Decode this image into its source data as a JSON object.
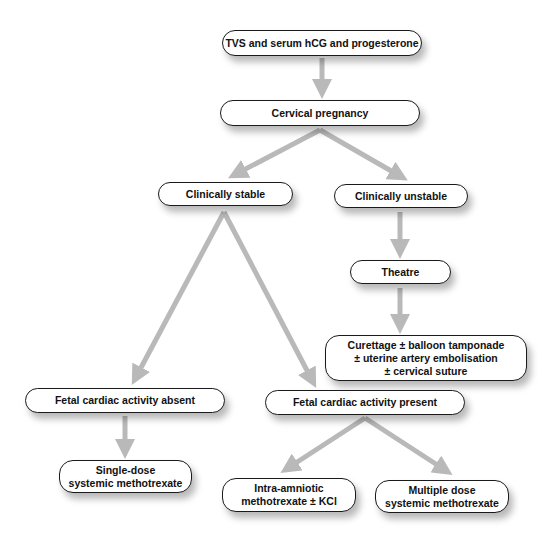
{
  "diagram": {
    "arrow_color": "#b9b9b9",
    "nodes": {
      "tvs": "TVS and serum hCG and progesterone",
      "cervical_pregnancy": "Cervical pregnancy",
      "clinically_stable": "Clinically stable",
      "clinically_unstable": "Clinically unstable",
      "theatre": "Theatre",
      "curettage": "Curettage ± balloon tamponade\n± uterine artery embolisation\n± cervical suture",
      "fetal_absent": "Fetal cardiac activity absent",
      "fetal_present": "Fetal cardiac activity present",
      "single_dose": "Single-dose\nsystemic methotrexate",
      "intra_amniotic": "Intra-amniotic\nmethotrexate ± KCl",
      "multiple_dose": "Multiple dose\nsystemic methotrexate"
    },
    "edges": [
      [
        "tvs",
        "cervical_pregnancy"
      ],
      [
        "cervical_pregnancy",
        "clinically_stable"
      ],
      [
        "cervical_pregnancy",
        "clinically_unstable"
      ],
      [
        "clinically_unstable",
        "theatre"
      ],
      [
        "theatre",
        "curettage"
      ],
      [
        "clinically_stable",
        "fetal_absent"
      ],
      [
        "clinically_stable",
        "fetal_present"
      ],
      [
        "fetal_absent",
        "single_dose"
      ],
      [
        "fetal_present",
        "intra_amniotic"
      ],
      [
        "fetal_present",
        "multiple_dose"
      ]
    ]
  }
}
